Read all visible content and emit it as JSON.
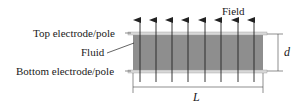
{
  "diagram": {
    "labels": {
      "field": "Field",
      "top_electrode": "Top electrode/pole",
      "fluid": "Fluid",
      "bottom_electrode": "Bottom electrode/pole",
      "gap": "d",
      "length": "L"
    },
    "colors": {
      "fluid": "#8e8e8e",
      "plate": "#d8d8d8",
      "line": "#222222"
    },
    "field_arrow_count": 8
  }
}
